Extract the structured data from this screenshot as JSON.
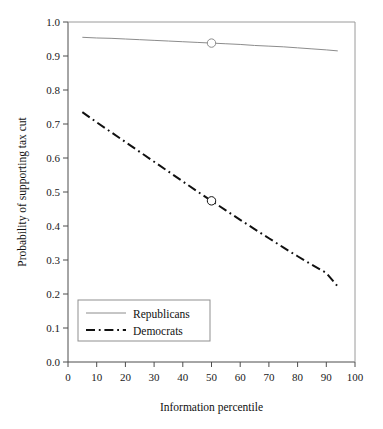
{
  "chart_data": {
    "type": "line",
    "title": "",
    "xlabel": "Information percentile",
    "ylabel": "Probability of supporting tax cut",
    "xlim": [
      0,
      100
    ],
    "ylim": [
      0.0,
      1.0
    ],
    "grid": false,
    "legend_position": "bottom-left",
    "xticks": [
      0,
      10,
      20,
      30,
      40,
      50,
      60,
      70,
      80,
      90,
      100
    ],
    "xtick_labels": [
      "0",
      "10",
      "20",
      "30",
      "40",
      "50",
      "60",
      "70",
      "80",
      "90",
      "100"
    ],
    "yticks": [
      0.0,
      0.1,
      0.2,
      0.3,
      0.4,
      0.5,
      0.6,
      0.7,
      0.8,
      0.9,
      1.0
    ],
    "ytick_labels": [
      "0.0",
      "0.1",
      "0.2",
      "0.3",
      "0.4",
      "0.5",
      "0.6",
      "0.7",
      "0.8",
      "0.9",
      "1.0"
    ],
    "x": [
      5,
      10,
      15,
      20,
      25,
      30,
      35,
      40,
      45,
      50,
      55,
      60,
      65,
      70,
      75,
      80,
      85,
      90,
      94
    ],
    "series": [
      {
        "name": "Republicans",
        "style": "solid",
        "color": "#8c8c8c",
        "width": 1,
        "marker_x": 50,
        "marker_y": 0.938,
        "values": [
          0.955,
          0.953,
          0.952,
          0.95,
          0.948,
          0.946,
          0.944,
          0.942,
          0.94,
          0.938,
          0.936,
          0.934,
          0.931,
          0.929,
          0.927,
          0.924,
          0.921,
          0.918,
          0.915
        ]
      },
      {
        "name": "Democrats",
        "style": "dash-dot",
        "color": "#111111",
        "width": 2,
        "marker_x": 50,
        "marker_y": 0.474,
        "values": [
          0.735,
          0.705,
          0.676,
          0.647,
          0.618,
          0.589,
          0.56,
          0.531,
          0.502,
          0.474,
          0.446,
          0.418,
          0.391,
          0.364,
          0.337,
          0.311,
          0.286,
          0.262,
          0.222
        ]
      }
    ],
    "legend": [
      {
        "label": "Republicans",
        "style": "solid",
        "color": "#8c8c8c"
      },
      {
        "label": "Democrats",
        "style": "dash-dot",
        "color": "#111111"
      }
    ]
  }
}
